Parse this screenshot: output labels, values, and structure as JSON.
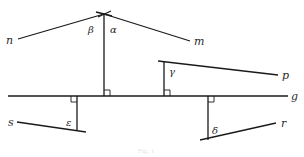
{
  "diagram": {
    "type": "geometry-perpendiculars",
    "background": "#ffffff",
    "stroke_color": "#1a1a1a",
    "baseline": {
      "id": "g",
      "label": "g",
      "x1": 8,
      "y1": 96,
      "x2": 288,
      "y2": 96,
      "label_x": 291,
      "label_y": 100
    },
    "lines": [
      {
        "id": "n",
        "label": "n",
        "x1": 18,
        "y1": 39,
        "x2": 104,
        "y2": 14,
        "label_x": 6,
        "label_y": 44
      },
      {
        "id": "m",
        "label": "m",
        "x1": 104,
        "y1": 14,
        "x2": 190,
        "y2": 41,
        "label_x": 194,
        "label_y": 45
      },
      {
        "id": "p",
        "label": "p",
        "x1": 158,
        "y1": 61,
        "x2": 278,
        "y2": 75,
        "label_x": 282,
        "label_y": 79
      },
      {
        "id": "s",
        "label": "s",
        "x1": 17,
        "y1": 122,
        "x2": 86,
        "y2": 132,
        "label_x": 8,
        "label_y": 126
      },
      {
        "id": "r",
        "label": "r",
        "x1": 200,
        "y1": 140,
        "x2": 276,
        "y2": 123,
        "label_x": 281,
        "label_y": 127
      }
    ],
    "perpendiculars": [
      {
        "id": "perp-nm",
        "x": 104,
        "y_top": 14,
        "y_bottom": 96,
        "right_angle_side": "right",
        "right_angle_at": "bottom"
      },
      {
        "id": "perp-p",
        "x": 164,
        "y_top": 61,
        "y_bottom": 96,
        "right_angle_side": "right",
        "right_angle_at": "bottom"
      },
      {
        "id": "perp-s",
        "x": 77,
        "y_top": 96,
        "y_bottom": 131,
        "right_angle_side": "left",
        "right_angle_at": "top"
      },
      {
        "id": "perp-r",
        "x": 208,
        "y_top": 96,
        "y_bottom": 140,
        "right_angle_side": "right",
        "right_angle_at": "top"
      }
    ],
    "angles": [
      {
        "id": "beta",
        "label": "β",
        "x": 88,
        "y": 33
      },
      {
        "id": "alpha",
        "label": "α",
        "x": 110,
        "y": 33
      },
      {
        "id": "gamma",
        "label": "γ",
        "x": 169,
        "y": 75
      },
      {
        "id": "epsilon",
        "label": "ε",
        "x": 66,
        "y": 126
      },
      {
        "id": "delta",
        "label": "δ",
        "x": 212,
        "y": 134
      }
    ],
    "apex_cross": {
      "x1": 96,
      "y1": 12,
      "x2": 112,
      "y2": 16,
      "x3": 98,
      "y3": 17,
      "x4": 111,
      "y4": 11
    },
    "caption": {
      "text": "Fig. 1",
      "x": 138,
      "y": 153
    }
  }
}
